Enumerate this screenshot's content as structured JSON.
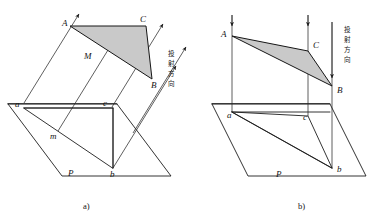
{
  "figure": {
    "title_not_shown": "",
    "background_color": "#ffffff",
    "line_color": "#1d1d1d",
    "triangle_fill_color": "#c9c9c9",
    "panels": [
      {
        "id": "panel-a",
        "caption": "a)",
        "projection_type": "oblique",
        "annotation_cjk": "投射方向",
        "annotation_cjk_chars": [
          "投",
          "射",
          "方",
          "向"
        ],
        "space_triangle_vertices": [
          "A",
          "C",
          "B"
        ],
        "projected_triangle_vertices": [
          "a",
          "c",
          "b"
        ],
        "extra_point_space": "M",
        "extra_point_projected": "m",
        "plane_label": "P",
        "labels": [
          {
            "text": "A",
            "x": 62,
            "y": 23
          },
          {
            "text": "C",
            "x": 141,
            "y": 19
          },
          {
            "text": "B",
            "x": 152,
            "y": 84
          },
          {
            "text": "M",
            "x": 86,
            "y": 56
          },
          {
            "text": "a",
            "x": 17,
            "y": 105
          },
          {
            "text": "c",
            "x": 104,
            "y": 104
          },
          {
            "text": "b",
            "x": 109,
            "y": 170
          },
          {
            "text": "m",
            "x": 52,
            "y": 136
          },
          {
            "text": "P",
            "x": 70,
            "y": 173
          }
        ]
      },
      {
        "id": "panel-b",
        "caption": "b)",
        "projection_type": "orthographic",
        "annotation_cjk": "投射方向",
        "annotation_cjk_chars": [
          "投",
          "射",
          "方",
          "向"
        ],
        "space_triangle_vertices": [
          "A",
          "C",
          "B"
        ],
        "projected_triangle_vertices": [
          "a",
          "c",
          "b"
        ],
        "plane_label": "P",
        "labels": [
          {
            "text": "A",
            "x": 224,
            "y": 33
          },
          {
            "text": "C",
            "x": 317,
            "y": 44
          },
          {
            "text": "B",
            "x": 340,
            "y": 91
          },
          {
            "text": "a",
            "x": 232,
            "y": 115
          },
          {
            "text": "c",
            "x": 306,
            "y": 116
          },
          {
            "text": "b",
            "x": 340,
            "y": 167
          },
          {
            "text": "P",
            "x": 277,
            "y": 174
          }
        ]
      }
    ],
    "captions": {
      "left": "a)",
      "right": "b)"
    }
  }
}
